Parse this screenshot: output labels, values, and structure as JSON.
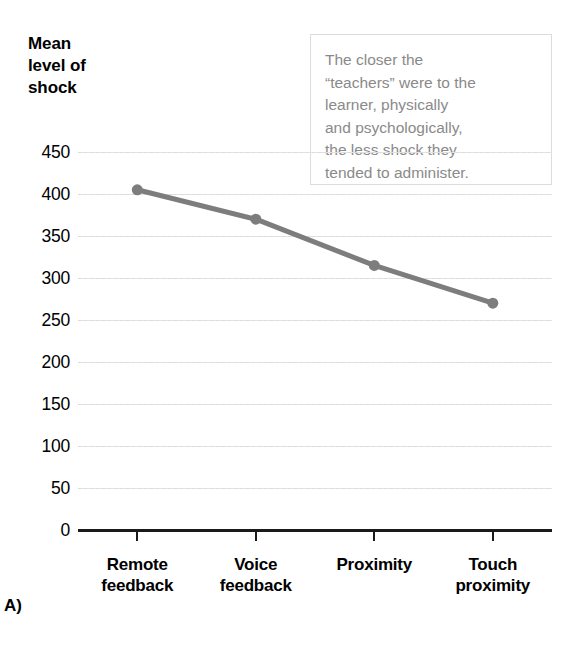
{
  "panel": {
    "letter": "A)"
  },
  "axis_title": {
    "lines": [
      "Mean",
      "level of",
      "shock"
    ]
  },
  "annotation": {
    "lines": [
      "The closer the",
      "“teachers” were to the",
      "learner, physically",
      "and psychologically,",
      "the less shock they",
      "tended to administer."
    ],
    "text_color": "#8a8a8a",
    "border_color": "#dcdcdc"
  },
  "chart_data": {
    "type": "line",
    "title": "Mean level of shock",
    "xlabel": "",
    "ylabel": "Mean level of shock",
    "categories": [
      "Remote feedback",
      "Voice feedback",
      "Proximity",
      "Touch proximity"
    ],
    "category_lines": [
      [
        "Remote",
        "feedback"
      ],
      [
        "Voice",
        "feedback"
      ],
      [
        "Proximity",
        ""
      ],
      [
        "Touch",
        "proximity"
      ]
    ],
    "values": [
      405,
      370,
      315,
      270
    ],
    "ylim": [
      0,
      450
    ],
    "ytick_labels": [
      "450",
      "400",
      "350",
      "300",
      "250",
      "200",
      "150",
      "100",
      "50",
      "0"
    ],
    "ytick_values": [
      450,
      400,
      350,
      300,
      250,
      200,
      150,
      100,
      50,
      0
    ],
    "grid": true,
    "grid_color": "#dcdcdc",
    "legend": "none",
    "series_color": "#7d7d7d",
    "marker": "circle",
    "axis_color": "#1a1a1a"
  }
}
